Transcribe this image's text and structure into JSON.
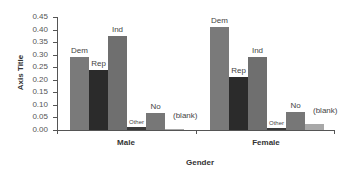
{
  "chart_data": {
    "type": "bar",
    "title": "",
    "xlabel": "Gender",
    "ylabel": "Axis Title",
    "ylim": [
      0,
      0.45
    ],
    "yticks": [
      "0.00",
      "0.05",
      "0.10",
      "0.15",
      "0.20",
      "0.25",
      "0.30",
      "0.35",
      "0.40",
      "0.45"
    ],
    "categories": [
      "Male",
      "Female"
    ],
    "series": [
      {
        "name": "Dem",
        "values": [
          0.29,
          0.41
        ],
        "color": "#7a7a7a"
      },
      {
        "name": "Rep",
        "values": [
          0.24,
          0.21
        ],
        "color": "#2b2b2b"
      },
      {
        "name": "Ind",
        "values": [
          0.375,
          0.29
        ],
        "color": "#6f6f6f"
      },
      {
        "name": "Other",
        "values": [
          0.01,
          0.008
        ],
        "color": "#3a3a3a"
      },
      {
        "name": "No",
        "values": [
          0.068,
          0.072
        ],
        "color": "#777777"
      },
      {
        "name": "(blank)",
        "values": [
          0.005,
          0.022
        ],
        "color": "#a8a8a8"
      }
    ],
    "grid": false,
    "legend": "none (data labels on bars)"
  }
}
